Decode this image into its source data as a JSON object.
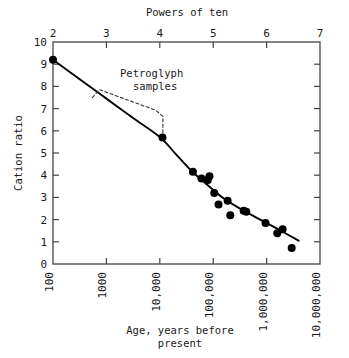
{
  "chart_data": {
    "type": "scatter",
    "title": "",
    "xlabel": "Age, years before present",
    "ylabel": "Cation ratio",
    "top_axis_label": "Powers of ten",
    "x_scale": "log10",
    "xlim": [
      2,
      7
    ],
    "ylim": [
      0,
      10
    ],
    "grid": false,
    "legend": false,
    "x_tick_labels": [
      "100",
      "1000",
      "10,000",
      "100,000",
      "1,000,000",
      "10,000,000"
    ],
    "x_tick_exponents": [
      2,
      3,
      4,
      5,
      6,
      7
    ],
    "top_tick_labels": [
      "2",
      "3",
      "4",
      "5",
      "6",
      "7"
    ],
    "y_tick_labels": [
      "0",
      "1",
      "2",
      "3",
      "4",
      "5",
      "6",
      "7",
      "8",
      "9",
      "10"
    ],
    "y_ticks": [
      0,
      1,
      2,
      3,
      4,
      5,
      6,
      7,
      8,
      9,
      10
    ],
    "points": [
      {
        "x": 2.0,
        "y": 9.2
      },
      {
        "x": 4.05,
        "y": 5.7
      },
      {
        "x": 4.62,
        "y": 4.15
      },
      {
        "x": 4.78,
        "y": 3.85
      },
      {
        "x": 4.9,
        "y": 3.78
      },
      {
        "x": 4.93,
        "y": 3.95
      },
      {
        "x": 5.02,
        "y": 3.2
      },
      {
        "x": 5.1,
        "y": 2.68
      },
      {
        "x": 5.27,
        "y": 2.85
      },
      {
        "x": 5.32,
        "y": 2.2
      },
      {
        "x": 5.57,
        "y": 2.4
      },
      {
        "x": 5.62,
        "y": 2.35
      },
      {
        "x": 5.98,
        "y": 1.85
      },
      {
        "x": 6.2,
        "y": 1.38
      },
      {
        "x": 6.3,
        "y": 1.57
      },
      {
        "x": 6.47,
        "y": 0.72
      }
    ],
    "fit_curve": [
      {
        "x": 2.0,
        "y": 9.2
      },
      {
        "x": 2.5,
        "y": 8.32
      },
      {
        "x": 3.0,
        "y": 7.45
      },
      {
        "x": 3.5,
        "y": 6.58
      },
      {
        "x": 4.0,
        "y": 5.72
      },
      {
        "x": 4.3,
        "y": 4.95
      },
      {
        "x": 4.6,
        "y": 4.18
      },
      {
        "x": 4.9,
        "y": 3.55
      },
      {
        "x": 5.2,
        "y": 2.95
      },
      {
        "x": 5.5,
        "y": 2.5
      },
      {
        "x": 5.8,
        "y": 2.1
      },
      {
        "x": 6.1,
        "y": 1.72
      },
      {
        "x": 6.4,
        "y": 1.32
      },
      {
        "x": 6.6,
        "y": 1.05
      }
    ],
    "annotations": [
      {
        "name": "petroglyph-samples",
        "text_line_1": "Petroglyph",
        "text_line_2": "samples",
        "bracket_from": {
          "x": 2.85,
          "y": 7.72
        },
        "bracket_to": {
          "x": 4.02,
          "y": 5.75
        }
      }
    ],
    "colors": {
      "axis": "#444444",
      "marker": "#000000",
      "curve": "#000000",
      "text": "#1a1a1a",
      "annotation_line": "#333333",
      "background": "#ffffff"
    }
  }
}
